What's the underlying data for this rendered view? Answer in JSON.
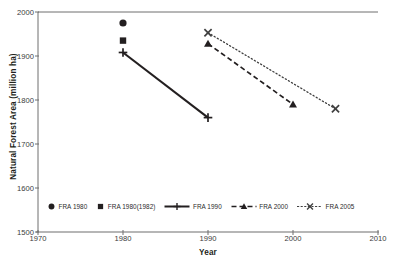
{
  "chart_data": {
    "type": "scatter",
    "title": "",
    "xlabel": "Year",
    "ylabel": "Natural Forest Area (million ha)",
    "xlim": [
      1970,
      2010
    ],
    "ylim": [
      1500,
      2000
    ],
    "xticks": [
      1970,
      1980,
      1990,
      2000,
      2010
    ],
    "yticks": [
      1500,
      1600,
      1700,
      1800,
      1900,
      2000
    ],
    "grid": false,
    "legend_position": "inside-bottom-left",
    "series": [
      {
        "name": "FRA 1980",
        "marker": "circle",
        "line_style": "none",
        "color": "#231f20",
        "x": [
          1980
        ],
        "values": [
          1975
        ]
      },
      {
        "name": "FRA 1980(1982)",
        "marker": "square",
        "line_style": "none",
        "color": "#231f20",
        "x": [
          1980
        ],
        "values": [
          1935
        ]
      },
      {
        "name": "FRA 1990",
        "marker": "plus",
        "line_style": "solid",
        "color": "#231f20",
        "x": [
          1980,
          1990
        ],
        "values": [
          1908,
          1760
        ]
      },
      {
        "name": "FRA 2000",
        "marker": "triangle",
        "line_style": "dashed",
        "color": "#231f20",
        "x": [
          1990,
          2000
        ],
        "values": [
          1928,
          1790
        ]
      },
      {
        "name": "FRA 2005",
        "marker": "x",
        "line_style": "dotted",
        "color": "#3f3f3f",
        "x": [
          1990,
          2005
        ],
        "values": [
          1953,
          1780
        ]
      }
    ]
  },
  "axes": {
    "y_title": "Natural Forest Area (million ha)",
    "x_title": "Year",
    "y_tick_labels": [
      "2000",
      "1900",
      "1800",
      "1700",
      "1600",
      "1500"
    ],
    "x_tick_labels": [
      "1970",
      "1980",
      "1990",
      "2000",
      "2010"
    ]
  },
  "legend": {
    "items": [
      {
        "label": "FRA 1980",
        "icon": "filled-circle-marker"
      },
      {
        "label": "FRA 1980(1982)",
        "icon": "filled-square-marker"
      },
      {
        "label": "FRA 1990",
        "icon": "solid-line-plus-marker"
      },
      {
        "label": "FRA 2000",
        "icon": "dashed-line-triangle-marker"
      },
      {
        "label": "FRA 2005",
        "icon": "dotted-line-x-marker"
      }
    ]
  },
  "colors": {
    "ink": "#231f20",
    "frame": "#6f6f6f",
    "tick_text": "#3b3b3b",
    "fra2005": "#3f3f3f"
  }
}
